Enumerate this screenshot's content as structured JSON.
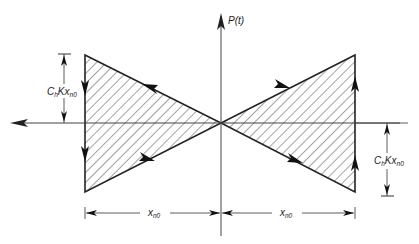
{
  "diagram": {
    "type": "hysteresis-loop",
    "axis_labels": {
      "vertical": "P(t)"
    },
    "dimension_labels": {
      "left_height": {
        "main": "C",
        "sub1": "h",
        "mid": "Kx",
        "sub2": "n0"
      },
      "right_height": {
        "main": "C",
        "sub1": "h",
        "mid": "Kx",
        "sub2": "n0"
      },
      "left_width": {
        "main": "x",
        "sub": "n0"
      },
      "right_width": {
        "main": "x",
        "sub": "n0"
      }
    },
    "colors": {
      "stroke": "#222222",
      "hatch": "#333333",
      "background": "#ffffff"
    }
  }
}
